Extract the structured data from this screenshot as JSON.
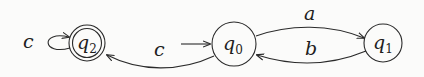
{
  "diagram": {
    "type": "finite-automaton",
    "states": [
      {
        "id": "q0",
        "name": "q",
        "subscript": "0",
        "initial": true,
        "accepting": false
      },
      {
        "id": "q1",
        "name": "q",
        "subscript": "1",
        "initial": false,
        "accepting": false
      },
      {
        "id": "q2",
        "name": "q",
        "subscript": "2",
        "initial": false,
        "accepting": true
      }
    ],
    "transitions": [
      {
        "from": "q0",
        "to": "q1",
        "label": "a"
      },
      {
        "from": "q1",
        "to": "q0",
        "label": "b"
      },
      {
        "from": "q0",
        "to": "q2",
        "label": "c"
      },
      {
        "from": "q2",
        "to": "q2",
        "label": "c"
      }
    ],
    "colors": {
      "stroke": "#2a2a2a",
      "text": "#1e1e1e",
      "background": "#fbfbfa"
    }
  }
}
